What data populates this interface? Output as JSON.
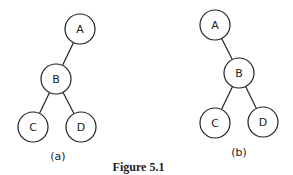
{
  "caption": "Figure 5.1",
  "node_radius": 15,
  "trees": [
    {
      "id": "a",
      "label": "(a)",
      "label_pos": [
        58,
        156
      ],
      "nodes": [
        {
          "id": "A",
          "label": "A",
          "x": 80,
          "y": 29
        },
        {
          "id": "B",
          "label": "B",
          "x": 56,
          "y": 79
        },
        {
          "id": "C",
          "label": "C",
          "x": 33,
          "y": 127
        },
        {
          "id": "D",
          "label": "D",
          "x": 81,
          "y": 127
        }
      ],
      "edges": [
        [
          "A",
          "B"
        ],
        [
          "B",
          "C"
        ],
        [
          "B",
          "D"
        ]
      ]
    },
    {
      "id": "b",
      "label": "(b)",
      "label_pos": [
        239,
        152
      ],
      "nodes": [
        {
          "id": "A",
          "label": "A",
          "x": 215,
          "y": 25
        },
        {
          "id": "B",
          "label": "B",
          "x": 239,
          "y": 73
        },
        {
          "id": "C",
          "label": "C",
          "x": 215,
          "y": 123
        },
        {
          "id": "D",
          "label": "D",
          "x": 263,
          "y": 122
        }
      ],
      "edges": [
        [
          "A",
          "B"
        ],
        [
          "B",
          "C"
        ],
        [
          "B",
          "D"
        ]
      ]
    }
  ]
}
